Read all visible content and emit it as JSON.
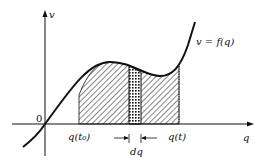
{
  "diagram": {
    "y_axis_label": "v",
    "x_axis_label": "q",
    "origin_label": "0",
    "curve_label": "v = f(q)",
    "lower_bound_label": "q(t₀)",
    "upper_bound_label": "q(t)",
    "strip_label": "dq",
    "colors": {
      "ink": "#111111",
      "background": "#ffffff"
    }
  }
}
